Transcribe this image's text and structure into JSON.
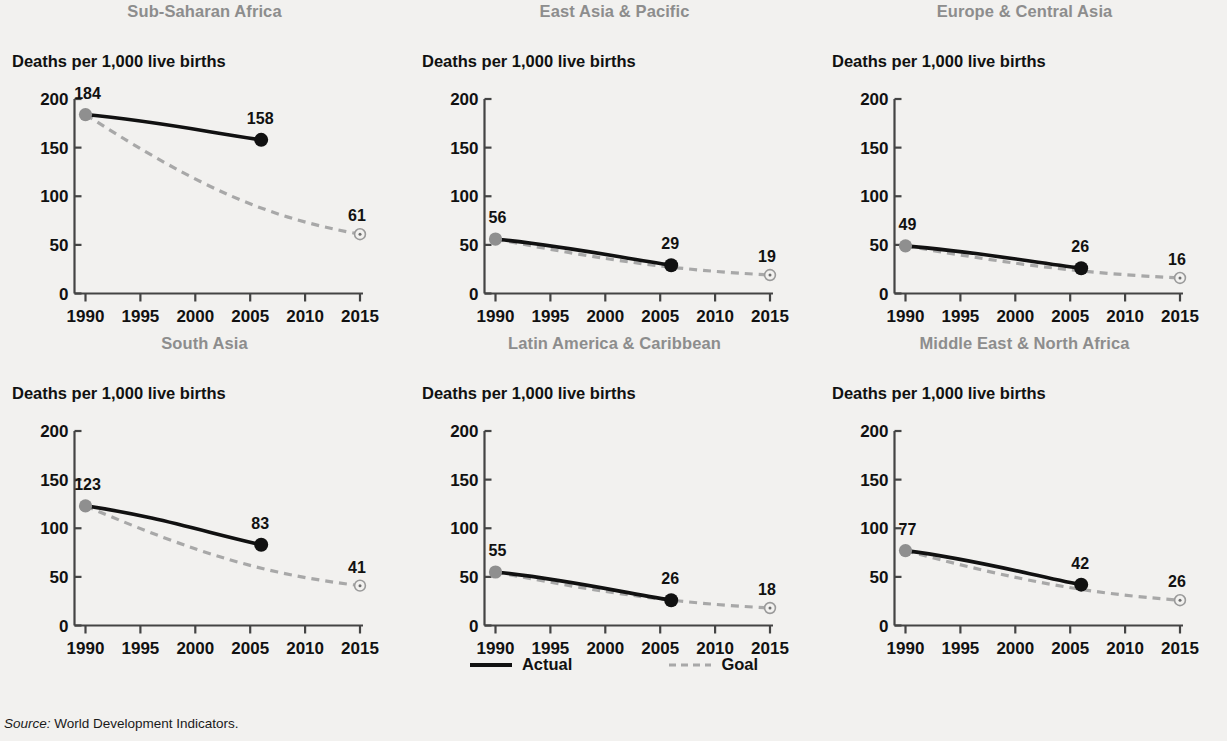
{
  "figure": {
    "y_axis_label": "Deaths per 1,000 live births",
    "source_label": "Source:",
    "source_text": " World Development Indicators.",
    "legend": [
      {
        "name": "actual",
        "label": "Actual",
        "style": "solid",
        "color": "#111111"
      },
      {
        "name": "goal",
        "label": "Goal",
        "style": "dashed",
        "color": "#a8a8a8"
      }
    ],
    "colors": {
      "background": "#f2f1ef",
      "title": "#8d8d8d",
      "actual_line": "#111111",
      "goal_line": "#a8a8a8",
      "start_marker": "#8f8f8f",
      "end_marker": "#111111",
      "axis": "#444444"
    }
  },
  "chart_data": [
    {
      "type": "line",
      "title": "Sub-Saharan Africa",
      "xlabel": "",
      "ylabel": "Deaths per 1,000 live births",
      "xlim": [
        1990,
        2015
      ],
      "ylim": [
        0,
        200
      ],
      "xticks": [
        1990,
        1995,
        2000,
        2005,
        2010,
        2015
      ],
      "yticks": [
        0,
        50,
        100,
        150,
        200
      ],
      "grid": false,
      "series": [
        {
          "name": "Actual",
          "style": "solid",
          "x": [
            1990,
            2006
          ],
          "values": [
            184,
            158
          ]
        },
        {
          "name": "Goal",
          "style": "dashed",
          "x": [
            1990,
            2015
          ],
          "values": [
            184,
            61
          ]
        }
      ],
      "point_labels": [
        {
          "label": "184",
          "x": 1990,
          "y": 184
        },
        {
          "label": "158",
          "x": 2006,
          "y": 158
        },
        {
          "label": "61",
          "x": 2015,
          "y": 61
        }
      ]
    },
    {
      "type": "line",
      "title": "East Asia & Pacific",
      "xlabel": "",
      "ylabel": "Deaths per 1,000 live births",
      "xlim": [
        1990,
        2015
      ],
      "ylim": [
        0,
        200
      ],
      "xticks": [
        1990,
        1995,
        2000,
        2005,
        2010,
        2015
      ],
      "yticks": [
        0,
        50,
        100,
        150,
        200
      ],
      "grid": false,
      "series": [
        {
          "name": "Actual",
          "style": "solid",
          "x": [
            1990,
            2006
          ],
          "values": [
            56,
            29
          ]
        },
        {
          "name": "Goal",
          "style": "dashed",
          "x": [
            1990,
            2015
          ],
          "values": [
            56,
            19
          ]
        }
      ],
      "point_labels": [
        {
          "label": "56",
          "x": 1990,
          "y": 56
        },
        {
          "label": "29",
          "x": 2006,
          "y": 29
        },
        {
          "label": "19",
          "x": 2015,
          "y": 19
        }
      ]
    },
    {
      "type": "line",
      "title": "Europe & Central Asia",
      "xlabel": "",
      "ylabel": "Deaths per 1,000 live births",
      "xlim": [
        1990,
        2015
      ],
      "ylim": [
        0,
        200
      ],
      "xticks": [
        1990,
        1995,
        2000,
        2005,
        2010,
        2015
      ],
      "yticks": [
        0,
        50,
        100,
        150,
        200
      ],
      "grid": false,
      "series": [
        {
          "name": "Actual",
          "style": "solid",
          "x": [
            1990,
            2006
          ],
          "values": [
            49,
            26
          ]
        },
        {
          "name": "Goal",
          "style": "dashed",
          "x": [
            1990,
            2015
          ],
          "values": [
            49,
            16
          ]
        }
      ],
      "point_labels": [
        {
          "label": "49",
          "x": 1990,
          "y": 49
        },
        {
          "label": "26",
          "x": 2006,
          "y": 26
        },
        {
          "label": "16",
          "x": 2015,
          "y": 16
        }
      ]
    },
    {
      "type": "line",
      "title": "South Asia",
      "xlabel": "",
      "ylabel": "Deaths per 1,000 live births",
      "xlim": [
        1990,
        2015
      ],
      "ylim": [
        0,
        200
      ],
      "xticks": [
        1990,
        1995,
        2000,
        2005,
        2010,
        2015
      ],
      "yticks": [
        0,
        50,
        100,
        150,
        200
      ],
      "grid": false,
      "series": [
        {
          "name": "Actual",
          "style": "solid",
          "x": [
            1990,
            2006
          ],
          "values": [
            123,
            83
          ]
        },
        {
          "name": "Goal",
          "style": "dashed",
          "x": [
            1990,
            2015
          ],
          "values": [
            123,
            41
          ]
        }
      ],
      "point_labels": [
        {
          "label": "123",
          "x": 1990,
          "y": 123
        },
        {
          "label": "83",
          "x": 2006,
          "y": 83
        },
        {
          "label": "41",
          "x": 2015,
          "y": 41
        }
      ]
    },
    {
      "type": "line",
      "title": "Latin America & Caribbean",
      "xlabel": "",
      "ylabel": "Deaths per 1,000 live births",
      "xlim": [
        1990,
        2015
      ],
      "ylim": [
        0,
        200
      ],
      "xticks": [
        1990,
        1995,
        2000,
        2005,
        2010,
        2015
      ],
      "yticks": [
        0,
        50,
        100,
        150,
        200
      ],
      "grid": false,
      "series": [
        {
          "name": "Actual",
          "style": "solid",
          "x": [
            1990,
            2006
          ],
          "values": [
            55,
            26
          ]
        },
        {
          "name": "Goal",
          "style": "dashed",
          "x": [
            1990,
            2015
          ],
          "values": [
            55,
            18
          ]
        }
      ],
      "point_labels": [
        {
          "label": "55",
          "x": 1990,
          "y": 55
        },
        {
          "label": "26",
          "x": 2006,
          "y": 26
        },
        {
          "label": "18",
          "x": 2015,
          "y": 18
        }
      ]
    },
    {
      "type": "line",
      "title": "Middle East & North Africa",
      "xlabel": "",
      "ylabel": "Deaths per 1,000 live births",
      "xlim": [
        1990,
        2015
      ],
      "ylim": [
        0,
        200
      ],
      "xticks": [
        1990,
        1995,
        2000,
        2005,
        2010,
        2015
      ],
      "yticks": [
        0,
        50,
        100,
        150,
        200
      ],
      "grid": false,
      "series": [
        {
          "name": "Actual",
          "style": "solid",
          "x": [
            1990,
            2006
          ],
          "values": [
            77,
            42
          ]
        },
        {
          "name": "Goal",
          "style": "dashed",
          "x": [
            1990,
            2015
          ],
          "values": [
            77,
            26
          ]
        }
      ],
      "point_labels": [
        {
          "label": "77",
          "x": 1990,
          "y": 77
        },
        {
          "label": "42",
          "x": 2006,
          "y": 42
        },
        {
          "label": "26",
          "x": 2015,
          "y": 26
        }
      ]
    }
  ]
}
